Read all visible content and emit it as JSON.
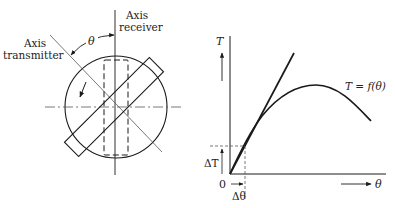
{
  "left_diagram": {
    "label_axis_receiver_line1": "Axis",
    "label_axis_receiver_line2": "receiver",
    "label_axis_transmitter_line1": "Axis",
    "label_axis_transmitter_line2": "transmitter",
    "label_angle": "θ"
  },
  "right_chart": {
    "y_axis_label": "T",
    "x_axis_label": "θ",
    "origin_label": "0",
    "curve_label": "T = f(θ)",
    "delta_t_label": "ΔT",
    "delta_theta_label": "Δθ"
  },
  "colors": {
    "stroke": "#1a1a1a",
    "thin_stroke": "#555555"
  }
}
